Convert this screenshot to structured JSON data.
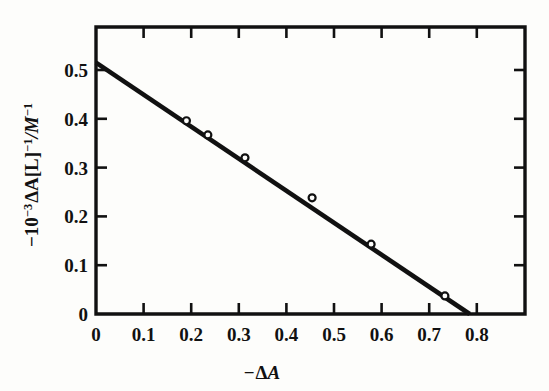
{
  "figure": {
    "name": "linear-regression-plot",
    "background_color": "#fdfdfb",
    "line_color": "#111111",
    "marker_fill_color": "#fdfdfb"
  },
  "chart_data": {
    "type": "scatter",
    "title": "",
    "subtitle": "",
    "xlabel": "−ΔA",
    "ylabel": "−10⁻³ΔA[L]⁻¹/M⁻¹",
    "xlabel_parts": {
      "minus": "−",
      "delta": "Δ",
      "a": "A"
    },
    "ylabel_parts": {
      "minus": "−",
      "ten": "10",
      "exp_neg3": "−3",
      "delta_a": "ΔA[L]",
      "exp_neg1_a": "−1",
      "slash_m": "/M",
      "exp_neg1_b": "−1"
    },
    "xlim": [
      0,
      0.9
    ],
    "ylim": [
      0,
      0.59
    ],
    "xticks": [
      0,
      0.1,
      0.2,
      0.3,
      0.4,
      0.5,
      0.6,
      0.7,
      0.8
    ],
    "xtick_labels": [
      "0",
      "0.1",
      "0.2",
      "0.3",
      "0.4",
      "0.5",
      "0.6",
      "0.7",
      "0.8"
    ],
    "yticks": [
      0,
      0.1,
      0.2,
      0.3,
      0.4,
      0.5
    ],
    "ytick_labels": [
      "0",
      "0.1",
      "0.2",
      "0.3",
      "0.4",
      "0.5"
    ],
    "grid": false,
    "legend": false,
    "ticks_direction": "in",
    "frame": "box-all-four-sides",
    "series": [
      {
        "name": "measured points",
        "marker": "open-circle",
        "x": [
          0.19,
          0.235,
          0.313,
          0.454,
          0.578,
          0.733
        ],
        "y": [
          0.396,
          0.367,
          0.32,
          0.238,
          0.143,
          0.037
        ]
      },
      {
        "name": "least-squares fit",
        "marker": "none",
        "style": "solid-thick",
        "x": [
          0.0,
          0.785
        ],
        "y": [
          0.515,
          0.0
        ],
        "intercept": 0.515,
        "slope": -0.656,
        "x_intercept": 0.785
      }
    ]
  },
  "geometry": {
    "plot_left_px": 96,
    "plot_right_px": 525,
    "plot_top_px": 27,
    "plot_bottom_px": 314,
    "x_origin_px": 96,
    "y_origin_px": 314,
    "px_per_x_unit": 476.0,
    "px_per_y_unit": 488.0
  }
}
